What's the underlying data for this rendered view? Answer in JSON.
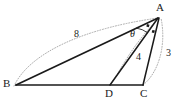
{
  "figure": {
    "type": "geometry-diagram",
    "stroke_color": "#1a1a1a",
    "dotted_color": "#9a9a9a"
  },
  "vertices": [
    {
      "id": "A",
      "label": "A",
      "x": 160,
      "y": 14
    },
    {
      "id": "B",
      "label": "B",
      "x": 12,
      "y": 84
    },
    {
      "id": "D",
      "label": "D",
      "x": 108,
      "y": 84
    },
    {
      "id": "C",
      "label": "C",
      "x": 142,
      "y": 84
    }
  ],
  "labels": {
    "A": "A",
    "B": "B",
    "C": "C",
    "D": "D",
    "side_BA": "8",
    "side_DA": "4",
    "side_CA": "3",
    "angle_at_A": "θ"
  },
  "measurements": [
    {
      "name": "BA",
      "from": "B",
      "to": "A",
      "value": "8"
    },
    {
      "name": "DA",
      "from": "D",
      "to": "A",
      "value": "4"
    },
    {
      "name": "CA",
      "from": "C",
      "to": "A",
      "value": "3"
    }
  ],
  "angles": [
    {
      "name": "theta",
      "at": "A",
      "between": [
        "AB",
        "AD"
      ],
      "label": "θ"
    },
    {
      "name": "equal-angle-mark-1",
      "at": "A",
      "marker": "filled-square"
    },
    {
      "name": "equal-angle-mark-2",
      "at": "A",
      "marker": "filled-square"
    }
  ],
  "segments": [
    {
      "name": "BA",
      "from": "B",
      "to": "A",
      "style": "solid"
    },
    {
      "name": "BC",
      "from": "B",
      "to": "C",
      "style": "solid"
    },
    {
      "name": "DA",
      "from": "D",
      "to": "A",
      "style": "solid"
    },
    {
      "name": "CA",
      "from": "C",
      "to": "A",
      "style": "solid"
    }
  ]
}
